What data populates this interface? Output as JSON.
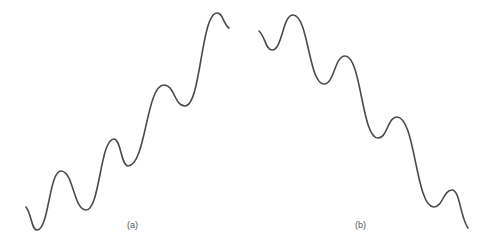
{
  "figure": {
    "panels": [
      {
        "id": "a",
        "caption": "(a)",
        "description": "Oscillating curve trending upward (sinusoid superimposed on rising ramp)",
        "stroke_color": "#4a4a4a",
        "points": [
          [
            26,
            207
          ],
          [
            37,
            230
          ],
          [
            61,
            171
          ],
          [
            86,
            210
          ],
          [
            114,
            139
          ],
          [
            128,
            166
          ],
          [
            164,
            85
          ],
          [
            185,
            106
          ],
          [
            217,
            13
          ],
          [
            229,
            28
          ]
        ]
      },
      {
        "id": "b",
        "caption": "(b)",
        "description": "Oscillating curve trending downward (sinusoid superimposed on falling ramp)",
        "stroke_color": "#4a4a4a",
        "points": [
          [
            259,
            31
          ],
          [
            272,
            50
          ],
          [
            293,
            15
          ],
          [
            324,
            84
          ],
          [
            345,
            56
          ],
          [
            378,
            138
          ],
          [
            397,
            117
          ],
          [
            434,
            207
          ],
          [
            452,
            190
          ],
          [
            468,
            228
          ]
        ]
      }
    ]
  }
}
